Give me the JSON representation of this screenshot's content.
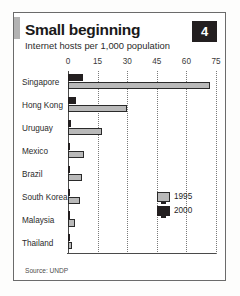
{
  "card": {
    "badge_number": "4",
    "title": "Small beginning",
    "subtitle": "Internet hosts per 1,000 population",
    "source": "Source: UNDP"
  },
  "legend": {
    "items": [
      {
        "label": "1995",
        "color": "#b9b9b9"
      },
      {
        "label": "2000",
        "color": "#231f20"
      }
    ]
  },
  "chart_data": {
    "type": "bar",
    "orientation": "horizontal",
    "title": "Small beginning",
    "subtitle": "Internet hosts per 1,000 population",
    "xlabel": "",
    "ylabel": "",
    "xlim": [
      0,
      75
    ],
    "xticks": [
      0,
      15,
      30,
      45,
      60,
      75
    ],
    "tick_labels": [
      "0",
      "15",
      "30",
      "45",
      "60",
      "75"
    ],
    "grid": true,
    "grid_style": "dotted-vertical",
    "legend_position": "inside-right",
    "categories": [
      "Singapore",
      "Hong Kong",
      "Uruguay",
      "Mexico",
      "Brazil",
      "South Korea",
      "Malaysia",
      "Thailand"
    ],
    "series": [
      {
        "name": "1995",
        "color": "#231f20",
        "values": [
          7.5,
          4.0,
          1.5,
          1.0,
          0.8,
          0.8,
          0.5,
          0.3
        ]
      },
      {
        "name": "2000",
        "color": "#b9b9b9",
        "values": [
          72.0,
          30.0,
          17.0,
          8.0,
          7.0,
          6.0,
          3.5,
          2.0
        ]
      }
    ],
    "source": "Source: UNDP"
  }
}
